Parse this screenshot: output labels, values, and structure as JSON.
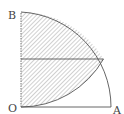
{
  "diagram": {
    "type": "geometry",
    "points": {
      "O": {
        "label": "O"
      },
      "A": {
        "label": "A"
      },
      "B": {
        "label": "B"
      }
    },
    "colors": {
      "stroke": "#555555",
      "hatch": "#8a8a8a",
      "label": "#444444"
    }
  }
}
